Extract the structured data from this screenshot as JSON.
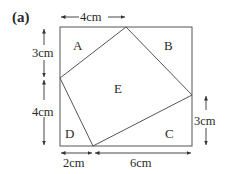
{
  "figure": {
    "label": "(a)",
    "regions": {
      "A": "A",
      "B": "B",
      "C": "C",
      "D": "D",
      "E": "E"
    },
    "measurements": {
      "top": "4cm",
      "left_upper": "3cm",
      "left_lower": "4cm",
      "right_lower": "3cm",
      "bottom_left": "2cm",
      "bottom_right": "6cm"
    },
    "colors": {
      "line": "#555555",
      "text": "#2a2a2a",
      "background": "#ffffff"
    }
  }
}
